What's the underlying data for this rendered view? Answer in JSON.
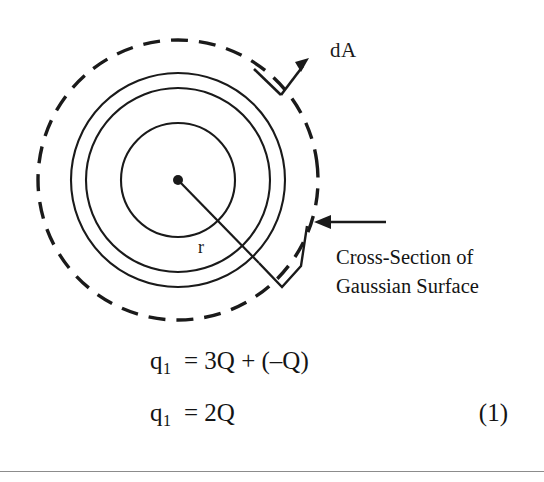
{
  "page": {
    "background_color": "#ffffff",
    "ink_color": "#1a1a1a",
    "width": 544,
    "height": 482
  },
  "figure": {
    "name": "gaussian-surface-cross-section",
    "center": {
      "x": 178,
      "y": 180
    },
    "dot_radius": 5,
    "circles": [
      {
        "name": "inner-sphere",
        "radius": 57,
        "style": "solid",
        "stroke_width": 2.1
      },
      {
        "name": "shell-inner-wall",
        "radius": 92,
        "style": "solid",
        "stroke_width": 2.1
      },
      {
        "name": "shell-outer-wall",
        "radius": 107,
        "style": "solid",
        "stroke_width": 2.1
      },
      {
        "name": "gaussian-surface",
        "radius": 140,
        "style": "dashed",
        "stroke_width": 3.4,
        "dash": "17 11"
      }
    ],
    "radius_line": {
      "from": {
        "x": 178,
        "y": 180
      },
      "to": {
        "x": 258,
        "y": 262
      }
    },
    "radius_label": "r",
    "da_label": "dA",
    "da_arrow": {
      "elbow_start": {
        "x": 255,
        "y": 70
      },
      "elbow_vertex": {
        "x": 281,
        "y": 94
      },
      "tip": {
        "x": 308,
        "y": 60
      }
    },
    "callout_arrow": {
      "tail": {
        "x": 386,
        "y": 222
      },
      "tip": {
        "x": 317,
        "y": 222
      }
    },
    "leader_polyline": "258,262 281,286 300,266 306,224"
  },
  "callout": {
    "line1": "Cross-Section of",
    "line2": "Gaussian Surface"
  },
  "equations": [
    {
      "name": "equation-q1-expanded",
      "variable": "q",
      "subscript": "1",
      "rhs": "= 3Q + (–Q)",
      "number": ""
    },
    {
      "name": "equation-q1-result",
      "variable": "q",
      "subscript": "1",
      "rhs": "= 2Q",
      "number": "(1)"
    }
  ]
}
